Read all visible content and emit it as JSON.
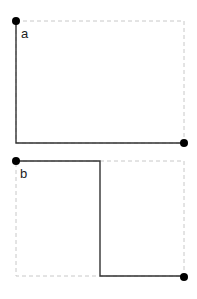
{
  "panels": [
    {
      "label": "a",
      "box": {
        "x1": 16,
        "y1": 21,
        "x2": 184,
        "y2": 143
      },
      "path": [
        [
          16,
          21
        ],
        [
          16,
          143
        ],
        [
          184,
          143
        ]
      ],
      "start": [
        16,
        21
      ],
      "end": [
        184,
        143
      ]
    },
    {
      "label": "b",
      "box": {
        "x1": 16,
        "y1": 161,
        "x2": 184,
        "y2": 276
      },
      "path": [
        [
          16,
          161
        ],
        [
          100,
          161
        ],
        [
          100,
          276
        ],
        [
          184,
          276
        ]
      ],
      "start": [
        16,
        161
      ],
      "end": [
        184,
        277
      ]
    }
  ],
  "colors": {
    "solid_line": "#333333",
    "dashed_box": "#c8c8c8",
    "dot": "#000000"
  }
}
